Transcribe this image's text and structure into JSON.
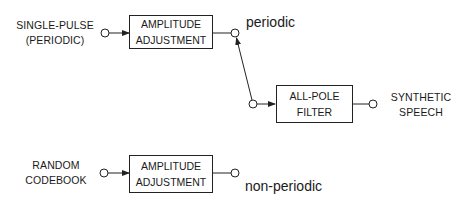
{
  "diagram": {
    "inputs": {
      "periodic_source": {
        "line1": "SINGLE-PULSE",
        "line2": "(PERIODIC)"
      },
      "random_source": {
        "line1": "RANDOM",
        "line2": "CODEBOOK"
      }
    },
    "blocks": {
      "amp_top": {
        "line1": "AMPLITUDE",
        "line2": "ADJUSTMENT"
      },
      "amp_bottom": {
        "line1": "AMPLITUDE",
        "line2": "ADJUSTMENT"
      },
      "filter": {
        "line1": "ALL-POLE",
        "line2": "FILTER"
      }
    },
    "switch_labels": {
      "periodic": "periodic",
      "non_periodic": "non-periodic"
    },
    "output": {
      "line1": "SYNTHETIC",
      "line2": "SPEECH"
    },
    "switch_position": "periodic",
    "colors": {
      "line": "#222222",
      "background": "#ffffff"
    }
  }
}
